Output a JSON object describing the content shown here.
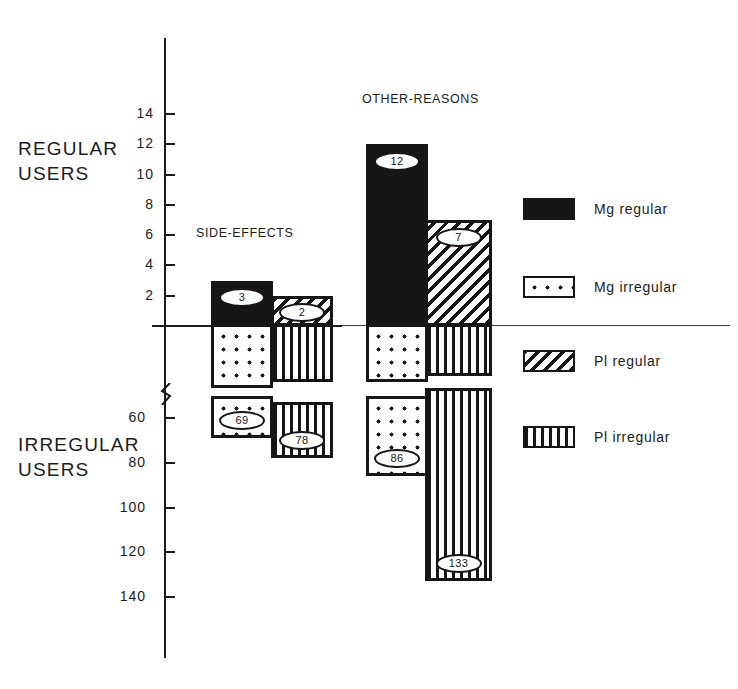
{
  "figure": {
    "axis_labels": {
      "upper_group": "REGULAR\nUSERS",
      "lower_group": "IRREGULAR\nUSERS"
    }
  },
  "chart_data": {
    "type": "bar",
    "title": "",
    "orientation": "vertical-bidirectional",
    "xlabel": "",
    "ylabel": "",
    "grid": false,
    "axis_break": true,
    "axis_note": "Upper axis counts regular users (0-14), lower axis counts irregular users (60-140); axis is broken between 0 and 60.",
    "upper_axis": {
      "ticks": [
        2,
        4,
        6,
        8,
        10,
        12,
        14
      ],
      "tick_labels": [
        "2",
        "4",
        "6",
        "8",
        "10",
        "12",
        "14"
      ],
      "range": [
        0,
        15
      ]
    },
    "lower_axis": {
      "ticks": [
        60,
        80,
        100,
        120,
        140
      ],
      "tick_labels": [
        "60",
        "80",
        "100",
        "120",
        "140"
      ],
      "range": [
        55,
        145
      ]
    },
    "categories": [
      "SIDE-EFFECTS",
      "OTHER-REASONS"
    ],
    "series": [
      {
        "name": "Mg regular",
        "pattern": "solid",
        "direction": "up",
        "values": [
          3,
          12
        ],
        "labels": [
          "3",
          "12"
        ]
      },
      {
        "name": "Mg irregular",
        "pattern": "dots",
        "direction": "down",
        "values": [
          69,
          86
        ],
        "labels": [
          "69",
          "86"
        ]
      },
      {
        "name": "Pl regular",
        "pattern": "diagonal-hatch",
        "direction": "up",
        "values": [
          2,
          7
        ],
        "labels": [
          "2",
          "7"
        ]
      },
      {
        "name": "Pl irregular",
        "pattern": "vertical-lines",
        "direction": "down",
        "values": [
          78,
          133
        ],
        "labels": [
          "78",
          "133"
        ]
      }
    ],
    "legend": {
      "position": "right",
      "entries": [
        {
          "label": "Mg regular",
          "pattern": "solid"
        },
        {
          "label": "Mg irregular",
          "pattern": "dots"
        },
        {
          "label": "Pl regular",
          "pattern": "diagonal-hatch"
        },
        {
          "label": "Pl irregular",
          "pattern": "vertical-lines"
        }
      ]
    }
  },
  "colors": {
    "ink": "#161616",
    "background": "#ffffff"
  }
}
